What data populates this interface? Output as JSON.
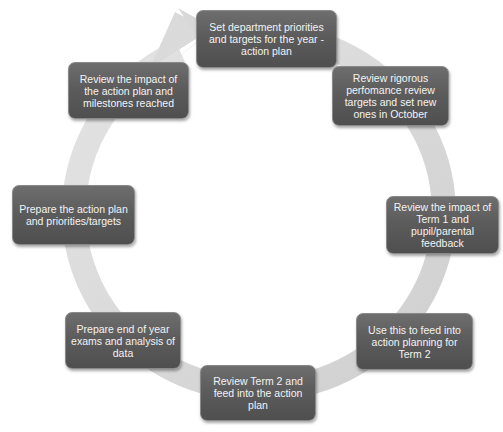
{
  "diagram": {
    "type": "cycle",
    "direction": "clockwise",
    "colors": {
      "node_fill": "#5c5c5c",
      "node_text": "#f3f3f3",
      "ring": "#d6d6d6",
      "background": "#ffffff"
    },
    "nodes": [
      {
        "id": 1,
        "label": "Set department priorities and targets for the year - action plan"
      },
      {
        "id": 2,
        "label": "Review rigorous perfomance review targets and set new ones in October"
      },
      {
        "id": 3,
        "label": "Review the impact of Term 1 and pupil/parental feedback"
      },
      {
        "id": 4,
        "label": "Use this to feed into action planning for Term 2"
      },
      {
        "id": 5,
        "label": "Review Term 2 and feed into the action plan"
      },
      {
        "id": 6,
        "label": "Prepare end of year exams and analysis of data"
      },
      {
        "id": 7,
        "label": "Prepare the action plan and priorities/targets"
      },
      {
        "id": 8,
        "label": "Review the impact of the action plan and milestones reached"
      }
    ]
  }
}
